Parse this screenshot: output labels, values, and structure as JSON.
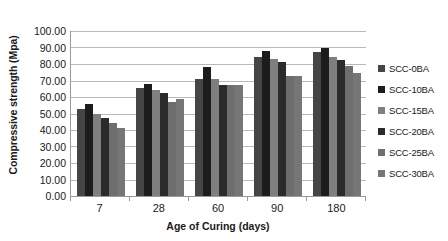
{
  "chart_data": {
    "type": "bar",
    "title": "",
    "xlabel": "Age of Curing (days)",
    "ylabel": "Compressive strength (Mpa)",
    "categories": [
      "7",
      "28",
      "60",
      "90",
      "180"
    ],
    "ylim": [
      0,
      100
    ],
    "ytick_labels": [
      "0.00",
      "10.00",
      "20.00",
      "30.00",
      "40.00",
      "50.00",
      "60.00",
      "70.00",
      "80.00",
      "90.00",
      "100.00"
    ],
    "ytick_values": [
      0,
      10,
      20,
      30,
      40,
      50,
      60,
      70,
      80,
      90,
      100
    ],
    "grid": true,
    "legend_position": "right",
    "series": [
      {
        "name": "SCC-0BA",
        "color": "#454545",
        "values": [
          52.5,
          65.5,
          71.0,
          84.5,
          87.5
        ]
      },
      {
        "name": "SCC-10BA",
        "color": "#1c1c1c",
        "values": [
          55.5,
          68.0,
          78.0,
          88.0,
          89.5
        ]
      },
      {
        "name": "SCC-15BA",
        "color": "#7f7f7f",
        "values": [
          49.5,
          64.5,
          71.0,
          83.0,
          84.5
        ]
      },
      {
        "name": "SCC-20BA",
        "color": "#2b2b2b",
        "values": [
          47.5,
          62.5,
          67.5,
          81.5,
          82.5
        ]
      },
      {
        "name": "SCC-25BA",
        "color": "#6e6e6e",
        "values": [
          44.5,
          57.0,
          67.0,
          73.0,
          79.0
        ]
      },
      {
        "name": "SCC-30BA",
        "color": "#767676",
        "values": [
          41.5,
          58.5,
          67.0,
          73.0,
          74.5
        ]
      }
    ]
  },
  "legend": {
    "items": [
      {
        "label": "SCC-0BA",
        "color": "#454545"
      },
      {
        "label": "SCC-10BA",
        "color": "#1c1c1c"
      },
      {
        "label": "SCC-15BA",
        "color": "#7f7f7f"
      },
      {
        "label": "SCC-20BA",
        "color": "#2b2b2b"
      },
      {
        "label": "SCC-25BA",
        "color": "#6e6e6e"
      },
      {
        "label": "SCC-30BA",
        "color": "#767676"
      }
    ]
  },
  "colors": {
    "gridline": "#b8b8b8",
    "axis": "#9a9a9a",
    "text": "#1a1a1a",
    "background": "#ffffff"
  }
}
